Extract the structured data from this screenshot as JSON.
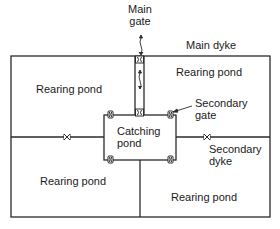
{
  "labels": {
    "main_gate": [
      "Main",
      "gate"
    ],
    "main_dyke": "Main dyke",
    "pond_top_left": "Rearing pond",
    "pond_top_right": "Rearing pond",
    "pond_bottom_left": "Rearing pond",
    "pond_bottom_right": "Rearing pond",
    "catching_pond": [
      "Catching",
      "pond"
    ],
    "secondary_gate": [
      "Secondary",
      "gate"
    ],
    "secondary_dyke": [
      "Secondary",
      "dyke"
    ]
  },
  "colors": {
    "line": "#2a2a2a",
    "text": "#1a1a1a",
    "background": "#ffffff"
  }
}
